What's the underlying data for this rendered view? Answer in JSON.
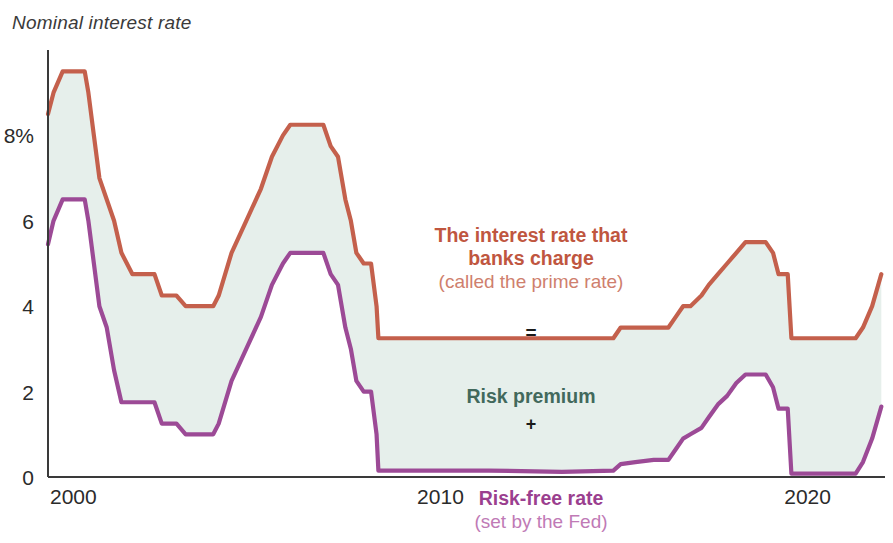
{
  "chart_data": {
    "type": "area",
    "title": "Nominal interest rate",
    "xlabel": "",
    "ylabel": "Nominal interest rate",
    "ylim": [
      0,
      10
    ],
    "xlim": [
      2000,
      2022.8
    ],
    "grid": false,
    "legend_position": "inline-annotations",
    "y_ticks": [
      "0",
      "2",
      "4",
      "6",
      "8%"
    ],
    "y_tick_values": [
      0,
      2,
      4,
      6,
      8
    ],
    "x_ticks": [
      "2000",
      "2010",
      "2020"
    ],
    "x_tick_values": [
      2000,
      2010,
      2020
    ],
    "band_fill_label": "Risk premium",
    "colors": {
      "prime": "#c4604c",
      "fed": "#9c4a96",
      "band_fill": "#e6efeb",
      "axis": "#3a3a3a",
      "title": "#3a3a3a",
      "risk_premium_text": "#42695c",
      "prime_text_bold": "#c0563f",
      "prime_text_light": "#cf7f6e",
      "fed_text_bold": "#9b3f8f",
      "fed_text_light": "#c07ab6"
    },
    "series": [
      {
        "name": "The interest rate that banks charge (called the prime rate)",
        "color": "#c4604c",
        "x": [
          2000.0,
          2000.15,
          2000.4,
          2000.55,
          2001.0,
          2001.1,
          2001.25,
          2001.4,
          2001.6,
          2001.8,
          2002.0,
          2002.3,
          2002.55,
          2002.9,
          2003.1,
          2003.5,
          2003.75,
          2004.0,
          2004.5,
          2004.65,
          2005.0,
          2005.4,
          2005.8,
          2006.1,
          2006.4,
          2006.6,
          2007.0,
          2007.5,
          2007.7,
          2007.9,
          2008.1,
          2008.25,
          2008.4,
          2008.6,
          2008.8,
          2008.95,
          2009.0,
          2010.0,
          2012.0,
          2014.0,
          2015.4,
          2015.6,
          2016.0,
          2016.5,
          2016.9,
          2017.1,
          2017.3,
          2017.5,
          2017.8,
          2018.0,
          2018.25,
          2018.5,
          2018.75,
          2019.0,
          2019.3,
          2019.55,
          2019.75,
          2019.9,
          2020.0,
          2020.15,
          2020.25,
          2021.0,
          2022.0,
          2022.2,
          2022.45,
          2022.7
        ],
        "y": [
          8.5,
          9.0,
          9.5,
          9.5,
          9.5,
          9.0,
          8.0,
          7.0,
          6.5,
          6.0,
          5.25,
          4.75,
          4.75,
          4.75,
          4.25,
          4.25,
          4.0,
          4.0,
          4.0,
          4.25,
          5.25,
          6.0,
          6.75,
          7.5,
          8.0,
          8.25,
          8.25,
          8.25,
          7.75,
          7.5,
          6.5,
          6.0,
          5.25,
          5.0,
          5.0,
          4.0,
          3.25,
          3.25,
          3.25,
          3.25,
          3.25,
          3.5,
          3.5,
          3.5,
          3.5,
          3.75,
          4.0,
          4.0,
          4.25,
          4.5,
          4.75,
          5.0,
          5.25,
          5.5,
          5.5,
          5.5,
          5.25,
          4.75,
          4.75,
          4.75,
          3.25,
          3.25,
          3.25,
          3.5,
          4.0,
          4.75
        ]
      },
      {
        "name": "Risk-free rate (set by the Fed)",
        "color": "#9c4a96",
        "x": [
          2000.0,
          2000.15,
          2000.4,
          2000.55,
          2001.0,
          2001.1,
          2001.25,
          2001.4,
          2001.6,
          2001.8,
          2002.0,
          2002.3,
          2002.55,
          2002.9,
          2003.1,
          2003.5,
          2003.75,
          2004.0,
          2004.5,
          2004.65,
          2005.0,
          2005.4,
          2005.8,
          2006.1,
          2006.4,
          2006.6,
          2007.0,
          2007.5,
          2007.7,
          2007.9,
          2008.1,
          2008.25,
          2008.4,
          2008.6,
          2008.8,
          2008.95,
          2009.0,
          2010.0,
          2012.0,
          2014.0,
          2015.4,
          2015.6,
          2016.0,
          2016.5,
          2016.9,
          2017.1,
          2017.3,
          2017.5,
          2017.8,
          2018.0,
          2018.25,
          2018.5,
          2018.75,
          2019.0,
          2019.3,
          2019.55,
          2019.75,
          2019.9,
          2020.0,
          2020.15,
          2020.25,
          2021.0,
          2022.0,
          2022.2,
          2022.45,
          2022.7
        ],
        "y": [
          5.45,
          6.0,
          6.5,
          6.5,
          6.5,
          6.0,
          5.0,
          4.0,
          3.5,
          2.5,
          1.75,
          1.75,
          1.75,
          1.75,
          1.25,
          1.25,
          1.0,
          1.0,
          1.0,
          1.25,
          2.25,
          3.0,
          3.75,
          4.5,
          5.0,
          5.25,
          5.25,
          5.25,
          4.75,
          4.5,
          3.5,
          3.0,
          2.25,
          2.0,
          2.0,
          1.0,
          0.15,
          0.15,
          0.15,
          0.12,
          0.15,
          0.3,
          0.35,
          0.4,
          0.4,
          0.65,
          0.9,
          1.0,
          1.15,
          1.4,
          1.7,
          1.9,
          2.2,
          2.4,
          2.4,
          2.4,
          2.1,
          1.6,
          1.6,
          1.6,
          0.08,
          0.08,
          0.08,
          0.35,
          0.9,
          1.65
        ]
      }
    ],
    "annotations": {
      "prime": {
        "line1": "The interest rate that",
        "line2": "banks charge",
        "line3": "(called the prime rate)"
      },
      "equals": "=",
      "risk_premium": "Risk premium",
      "plus": "+",
      "fed": {
        "line1": "Risk-free rate",
        "line2": "(set by the Fed)"
      }
    }
  }
}
